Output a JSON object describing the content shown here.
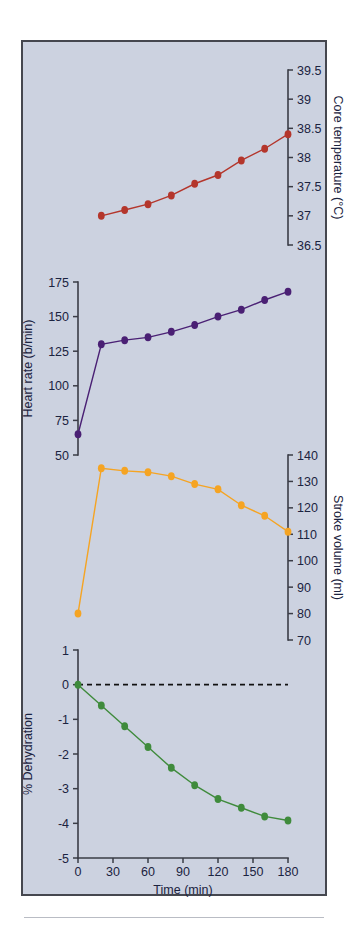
{
  "figure": {
    "background_color": "#ccd2e0",
    "border_color": "#45474f",
    "x_axis_label": "Time (min)",
    "x_ticks": [
      "0",
      "30",
      "60",
      "90",
      "120",
      "150",
      "180"
    ],
    "x_tick_values": [
      0,
      30,
      60,
      90,
      120,
      150,
      180
    ],
    "x_range": [
      0,
      180
    ]
  },
  "chart_data": [
    {
      "type": "line",
      "title": "",
      "name": "core-temperature",
      "ylabel": "Core temperature (°C)",
      "xlabel": "Time (min)",
      "color": "#b4362c",
      "axis_side": "right",
      "ylim": [
        36.5,
        39.5
      ],
      "yticks": [
        36.5,
        37,
        37.5,
        38,
        38.5,
        39,
        39.5
      ],
      "ytick_labels": [
        "36.5",
        "37",
        "37.5",
        "38",
        "38.5",
        "39",
        "39.5"
      ],
      "x": [
        20,
        40,
        60,
        80,
        100,
        120,
        140,
        160,
        180
      ],
      "values": [
        37.0,
        37.1,
        37.2,
        37.35,
        37.55,
        37.7,
        37.95,
        38.15,
        38.4
      ],
      "x_full": [
        20,
        40,
        60,
        80,
        100,
        120,
        140,
        160,
        180,
        180
      ],
      "grid": false,
      "legend": "none"
    },
    {
      "type": "line",
      "title": "",
      "name": "heart-rate",
      "ylabel": "Heart rate (b/min)",
      "xlabel": "Time (min)",
      "color": "#4a2074",
      "axis_side": "left",
      "ylim": [
        50,
        175
      ],
      "yticks": [
        50,
        75,
        100,
        125,
        150,
        175
      ],
      "ytick_labels": [
        "50",
        "75",
        "100",
        "125",
        "150",
        "175"
      ],
      "x": [
        0,
        20,
        40,
        60,
        80,
        100,
        120,
        140,
        160,
        180
      ],
      "values": [
        65,
        130,
        133,
        135,
        139,
        144,
        150,
        155,
        162,
        168
      ],
      "grid": false,
      "legend": "none"
    },
    {
      "type": "line",
      "title": "",
      "name": "stroke-volume",
      "ylabel": "Stroke volume (ml)",
      "xlabel": "Time (min)",
      "color": "#f5a423",
      "axis_side": "right",
      "ylim": [
        70,
        140
      ],
      "yticks": [
        70,
        80,
        90,
        100,
        110,
        120,
        130,
        140
      ],
      "ytick_labels": [
        "70",
        "80",
        "90",
        "100",
        "110",
        "120",
        "130",
        "140"
      ],
      "x": [
        0,
        20,
        40,
        60,
        80,
        100,
        120,
        140,
        160,
        180
      ],
      "values": [
        80,
        135,
        134,
        133.5,
        132,
        129,
        127,
        121,
        117,
        111
      ],
      "grid": false,
      "legend": "none"
    },
    {
      "type": "line",
      "title": "",
      "name": "dehydration",
      "ylabel": "% Dehydration",
      "xlabel": "Time (min)",
      "color": "#3f8b3c",
      "axis_side": "left",
      "ylim": [
        -5,
        1
      ],
      "yticks": [
        -5,
        -4,
        -3,
        -2,
        -1,
        0,
        1
      ],
      "ytick_labels": [
        "-5",
        "-4",
        "-3",
        "-2",
        "-1",
        "0",
        "1"
      ],
      "x": [
        0,
        20,
        40,
        60,
        80,
        100,
        120,
        140,
        160,
        180
      ],
      "values": [
        0,
        -0.6,
        -1.2,
        -1.8,
        -2.4,
        -2.9,
        -3.3,
        -3.55,
        -3.8,
        -3.92
      ],
      "reference_line": 0,
      "grid": false,
      "legend": "none"
    }
  ]
}
